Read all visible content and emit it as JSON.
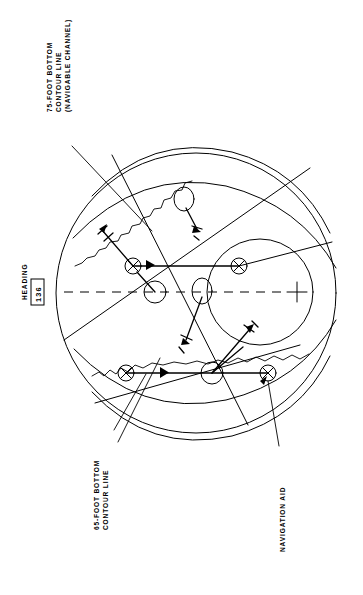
{
  "figure": {
    "kind": "radar-ppi-display",
    "background_color": "#ffffff",
    "line_color": "#000000"
  },
  "heading_readout": {
    "label": "HEADING",
    "value": "136"
  },
  "annotations": {
    "contour_75": {
      "line1": "75-FOOT BOTTOM",
      "line2": "CONTOUR LINE",
      "line3": "(NAVIGABLE CHANNEL)"
    },
    "contour_65": {
      "line1": "65-FOOT BOTTOM",
      "line2": "CONTOUR LINE"
    },
    "nav_aid": {
      "line1": "NAVIGATION AID"
    }
  },
  "symbols": {
    "own_ship": "crosshair-icon",
    "nav_aid_marker": "circle-x-icon",
    "contact_marker": "circle-icon",
    "vector_tick": "vector-tick-icon"
  }
}
